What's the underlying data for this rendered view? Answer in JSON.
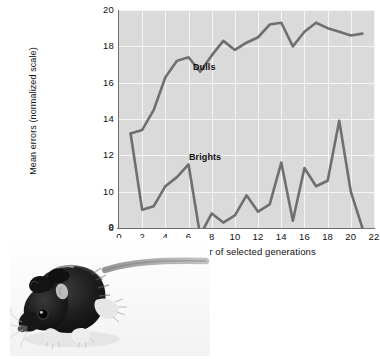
{
  "figure": {
    "caption_absent": true,
    "photo": {
      "name": "laboratory-rat-photograph",
      "subject": "black laboratory rat in profile with long tail extending to the right"
    }
  },
  "chart_data": {
    "type": "line",
    "title": "",
    "xlabel": "Number of selected generations",
    "ylabel": "Mean errors (normalized scale)",
    "xlim": [
      0,
      22
    ],
    "ylim": [
      8,
      20
    ],
    "y_axis_break_label": "0",
    "grid": true,
    "legend_position": "inline-annotations",
    "xticks": [
      0,
      2,
      4,
      6,
      8,
      10,
      12,
      14,
      16,
      18,
      20,
      22
    ],
    "yticks": [
      8,
      10,
      12,
      14,
      16,
      18,
      20
    ],
    "x": [
      1,
      2,
      3,
      4,
      5,
      6,
      7,
      8,
      9,
      10,
      11,
      12,
      13,
      14,
      15,
      16,
      17,
      18,
      19,
      20,
      21
    ],
    "series": [
      {
        "name": "Dulls",
        "color": "#6e6f6e",
        "values": [
          13.2,
          13.4,
          14.5,
          16.3,
          17.2,
          17.4,
          16.6,
          17.5,
          18.3,
          17.8,
          18.2,
          18.5,
          19.2,
          19.3,
          18.0,
          18.8,
          19.3,
          19.0,
          18.8,
          18.6,
          18.7
        ]
      },
      {
        "name": "Brights",
        "color": "#6e6f6e",
        "values": [
          13.2,
          9.0,
          9.2,
          10.3,
          10.8,
          11.5,
          7.6,
          8.8,
          8.3,
          8.7,
          9.8,
          8.9,
          9.3,
          11.6,
          8.4,
          11.3,
          10.3,
          10.6,
          13.9,
          10.0,
          8.0
        ]
      }
    ],
    "annotations": [
      {
        "text": "Dulls",
        "x": 8.0,
        "y": 16.9
      },
      {
        "text": "Brights",
        "x": 7.6,
        "y": 10.8
      }
    ],
    "colors": {
      "plot_background": "#d9dad9",
      "gridline": "#f4f5f4",
      "axis": "#6e6f6e",
      "line": "#6e6f6e",
      "text": "#111111",
      "page_background": "#ffffff"
    }
  }
}
